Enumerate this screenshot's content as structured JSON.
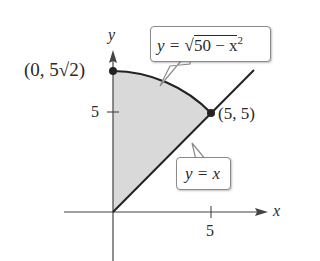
{
  "figure": {
    "axes": {
      "x_label": "x",
      "y_label": "y",
      "x_tick_label": "5",
      "y_tick_label": "5"
    },
    "points": [
      {
        "label": "(0, 5√2)",
        "x": 0,
        "y": 7.07
      },
      {
        "label": "(5, 5)",
        "x": 5,
        "y": 5
      }
    ],
    "curves": [
      {
        "label_prefix": "y = ",
        "label_radical": "50 − x",
        "label_exp": "2",
        "equation": "y = √(50 − x²)"
      },
      {
        "label": "y = x",
        "equation": "y = x"
      }
    ],
    "region": {
      "description": "shaded region between y = x and y = √(50 − x²) for 0 ≤ x ≤ 5",
      "fill": "#d9d9d9"
    },
    "colors": {
      "ink": "#2a2a2a",
      "shade": "#d9d9d9",
      "callout_border": "#8a8a8a"
    }
  }
}
